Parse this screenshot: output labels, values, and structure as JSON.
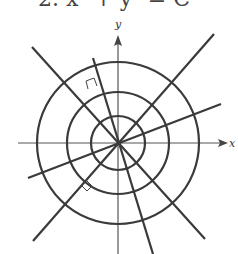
{
  "figure": {
    "header_text": "2. x² + y² = C",
    "x_axis_label": "x",
    "y_axis_label": "y",
    "center": [
      118,
      143
    ],
    "circles": [
      {
        "name": "inner",
        "r": 27
      },
      {
        "name": "middle",
        "r": 51
      },
      {
        "name": "outer",
        "r": 81
      }
    ],
    "lines": [
      {
        "name": "diag-upleft-downright",
        "x1": 32,
        "y1": 47,
        "x2": 205,
        "y2": 239
      },
      {
        "name": "diag-downleft-upright",
        "x1": 33,
        "y1": 241,
        "x2": 214,
        "y2": 34
      },
      {
        "name": "shallow-line",
        "x1": 28,
        "y1": 178,
        "x2": 221,
        "y2": 104
      },
      {
        "name": "steep-line",
        "x1": 93,
        "y1": 58,
        "x2": 153,
        "y2": 254
      }
    ],
    "right_angle_markers": [
      {
        "name": "upper-marker"
      },
      {
        "name": "lower-marker"
      }
    ],
    "colors": {
      "stroke": "#3a3a3a",
      "axis": "#555555",
      "background": "#ffffff"
    }
  }
}
